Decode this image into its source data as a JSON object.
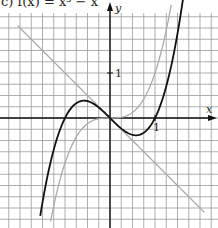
{
  "title": "c) f(x) = x³ − x",
  "chart_data": {
    "type": "line",
    "title": "c) f(x) = x³ − x",
    "xlabel": "x",
    "ylabel": "y",
    "tick_labels": {
      "x": "1",
      "y": "1"
    },
    "grid": true,
    "grid_step": 0.25,
    "xlim": [
      -2.45,
      2.3
    ],
    "ylim": [
      -2.45,
      2.35
    ],
    "series": [
      {
        "name": "f(x) = x³ − x",
        "color": "#111111",
        "expression": "x^3 - x",
        "points": [
          [
            -1.5,
            -1.875
          ],
          [
            -1,
            0
          ],
          [
            -0.577,
            0.385
          ],
          [
            0,
            0
          ],
          [
            0.577,
            -0.385
          ],
          [
            1,
            0
          ],
          [
            1.5,
            1.875
          ]
        ]
      },
      {
        "name": "x³",
        "color": "#aaaaaa",
        "expression": "x^3",
        "points": [
          [
            -1.3,
            -2.197
          ],
          [
            -1,
            -1
          ],
          [
            0,
            0
          ],
          [
            1,
            1
          ],
          [
            1.3,
            2.197
          ]
        ]
      },
      {
        "name": "y = −x",
        "color": "#aaaaaa",
        "expression": "-x",
        "points": [
          [
            -2.05,
            2.05
          ],
          [
            0,
            0
          ],
          [
            2.1,
            -2.1
          ]
        ]
      }
    ]
  }
}
